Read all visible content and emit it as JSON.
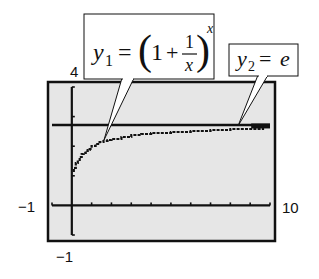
{
  "chart_data": {
    "type": "line",
    "title": "",
    "xlabel": "",
    "ylabel": "",
    "xlim": [
      -1,
      10
    ],
    "ylim": [
      -1,
      4
    ],
    "grid": false,
    "window_labels": {
      "ymax": "4",
      "ymin": "−1",
      "xmin": "−1",
      "xmax": "10"
    },
    "x_tick_step": 1,
    "y_tick_step": 1,
    "series": [
      {
        "name": "y1 = (1 + 1/x)^x",
        "style": "stepped-dots",
        "x": [
          0.05,
          0.1,
          0.2,
          0.3,
          0.4,
          0.5,
          0.6,
          0.7,
          0.8,
          0.9,
          1.0,
          1.2,
          1.4,
          1.6,
          1.8,
          2.0,
          2.5,
          3.0,
          3.5,
          4.0,
          5.0,
          6.0,
          7.0,
          8.0,
          9.0,
          9.7
        ],
        "values": [
          1.16,
          1.27,
          1.43,
          1.54,
          1.63,
          1.73,
          1.78,
          1.83,
          1.88,
          1.92,
          2.0,
          2.08,
          2.13,
          2.18,
          2.22,
          2.25,
          2.32,
          2.37,
          2.41,
          2.44,
          2.49,
          2.52,
          2.55,
          2.57,
          2.58,
          2.59
        ]
      },
      {
        "name": "y2 = e",
        "style": "horizontal-line",
        "x": [
          -1,
          10
        ],
        "values": [
          2.718,
          2.718
        ]
      }
    ],
    "annotations": [
      {
        "id": "callout-y1",
        "lhs": "y",
        "sub": "1",
        "equals": "=",
        "open_paren": "(",
        "one": "1",
        "plus": "+",
        "frac_num": "1",
        "frac_den": "x",
        "close_paren": ")",
        "exponent": "x",
        "points_to": [
          0.75,
          2.25
        ]
      },
      {
        "id": "callout-y2",
        "lhs": "y",
        "sub": "2",
        "equals": "=",
        "rhs": "e",
        "points_to": [
          8.25,
          2.718
        ]
      }
    ],
    "colors": {
      "screen_background": "#e6e6e6",
      "ink": "#111111",
      "callout_fill": "#ffffff"
    }
  }
}
